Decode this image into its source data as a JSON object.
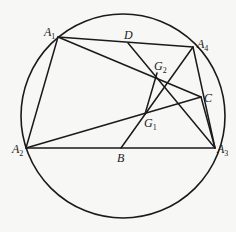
{
  "diagram": {
    "type": "geometry",
    "circle": {
      "cx": 123,
      "cy": 116,
      "r": 102
    },
    "points": {
      "A1": {
        "x": 58,
        "y": 37,
        "label": "A",
        "sub": "1",
        "lx": 44,
        "ly": 36
      },
      "A2": {
        "x": 26,
        "y": 148,
        "label": "A",
        "sub": "2",
        "lx": 12,
        "ly": 153
      },
      "A3": {
        "x": 215,
        "y": 148,
        "label": "A",
        "sub": "3",
        "lx": 217,
        "ly": 153
      },
      "A4": {
        "x": 193,
        "y": 47,
        "label": "A",
        "sub": "4",
        "lx": 197,
        "ly": 48
      },
      "B": {
        "x": 121,
        "y": 148,
        "label": "B",
        "sub": "",
        "lx": 117,
        "ly": 162
      },
      "C": {
        "x": 201,
        "y": 97,
        "label": "C",
        "sub": "",
        "lx": 204,
        "ly": 102
      },
      "D": {
        "x": 128,
        "y": 43,
        "label": "D",
        "sub": "",
        "lx": 124,
        "ly": 39
      },
      "G1": {
        "x": 145,
        "y": 114,
        "label": "G",
        "sub": "1",
        "lx": 144,
        "ly": 127
      },
      "G2": {
        "x": 157,
        "y": 73,
        "label": "G",
        "sub": "2",
        "lx": 154,
        "ly": 70
      }
    },
    "segments": [
      [
        "A1",
        "A2"
      ],
      [
        "A1",
        "A4"
      ],
      [
        "A1",
        "C"
      ],
      [
        "A2",
        "A3"
      ],
      [
        "A2",
        "C"
      ],
      [
        "A4",
        "A3"
      ],
      [
        "A4",
        "B"
      ],
      [
        "D",
        "A3"
      ],
      [
        "G2",
        "G1"
      ],
      [
        "C",
        "A3"
      ]
    ],
    "stroke_color": "#1a1a1a"
  }
}
